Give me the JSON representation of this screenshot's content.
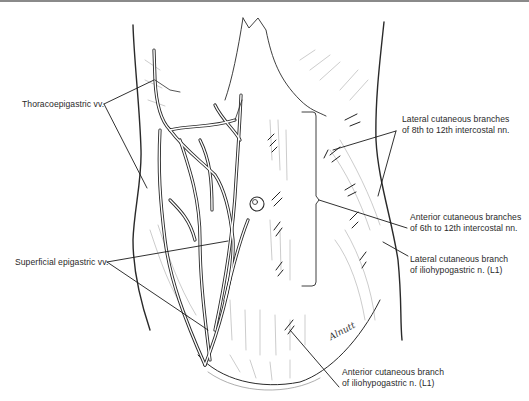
{
  "figure": {
    "type": "anatomical line illustration",
    "artist_signature": "Alnutt"
  },
  "labels": {
    "thoracoepigastric": "Thoracoepigastric vv.",
    "superficial_epigastric": "Superficial epigastric vv.",
    "lateral_cutaneous_intercostal": [
      "Lateral cutaneous branches",
      "of 8th to 12th intercostal nn."
    ],
    "anterior_cutaneous_intercostal": [
      "Anterior cutaneous branches",
      "of 6th to 12th intercostal nn."
    ],
    "lateral_cutaneous_iliohypogastric": [
      "Lateral cutaneous branch",
      "of iliohypogastric n. (L1)"
    ],
    "anterior_cutaneous_iliohypogastric": [
      "Anterior cutaneous branch",
      "of iliohypogastric n. (L1)"
    ]
  },
  "colors": {
    "ink": "#2a2a2a",
    "rule": "#8a8a8a",
    "background": "#ffffff"
  }
}
